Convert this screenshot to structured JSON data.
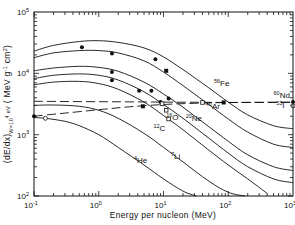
{
  "chart_data": {
    "type": "line",
    "title": "",
    "xlabel": "Energy per nucleon (MeV)",
    "ylabel": "(dE/dx)_{W=10^4 eV} (MeV g^-1 cm^2)",
    "xscale": "log",
    "yscale": "log",
    "xlim": [
      0.1,
      1000
    ],
    "ylim": [
      100,
      100000
    ],
    "x_ticks": [
      {
        "value": 0.1,
        "base": "10",
        "exp": "-1"
      },
      {
        "value": 1,
        "base": "10",
        "exp": "0"
      },
      {
        "value": 10,
        "base": "10",
        "exp": "1"
      },
      {
        "value": 100,
        "base": "10",
        "exp": "2"
      },
      {
        "value": 1000,
        "base": "10",
        "exp": "3"
      }
    ],
    "y_ticks": [
      {
        "value": 100,
        "base": "10",
        "exp": "2"
      },
      {
        "value": 1000,
        "base": "10",
        "exp": "3"
      },
      {
        "value": 10000,
        "base": "10",
        "exp": "4"
      },
      {
        "value": 100000,
        "base": "10",
        "exp": "5"
      }
    ],
    "series": [
      {
        "name": "56Fe",
        "mass": "56",
        "sym": "Fe",
        "style": "solid",
        "x": [
          0.1,
          0.2,
          0.5,
          1,
          2,
          5,
          10,
          20,
          50,
          100,
          200,
          500,
          1000
        ],
        "y": [
          23000,
          28500,
          33000,
          34000,
          32000,
          26000,
          18500,
          11500,
          5800,
          3400,
          2100,
          1400,
          1250
        ]
      },
      {
        "name": "40Ar",
        "mass": "40",
        "sym": "Ar",
        "style": "solid",
        "x": [
          0.1,
          0.2,
          0.5,
          1,
          2,
          5,
          10,
          20,
          50,
          100,
          200,
          500,
          1000
        ],
        "y": [
          18000,
          21500,
          23500,
          23500,
          21500,
          16000,
          10500,
          6300,
          3100,
          1800,
          1100,
          700,
          620
        ]
      },
      {
        "name": "20Ne",
        "mass": "20",
        "sym": "Ne",
        "style": "solid",
        "x": [
          0.1,
          0.2,
          0.5,
          1,
          2,
          5,
          10,
          20,
          50,
          100,
          200,
          500,
          1000
        ],
        "y": [
          11000,
          12200,
          13000,
          12500,
          10800,
          7200,
          4600,
          2800,
          1350,
          780,
          470,
          300,
          260
        ]
      },
      {
        "name": "16O",
        "mass": "16",
        "sym": "O",
        "style": "solid",
        "x": [
          0.1,
          0.2,
          0.5,
          1,
          2,
          5,
          10,
          20,
          50,
          100,
          200,
          500,
          1000
        ],
        "y": [
          8200,
          9300,
          9800,
          9300,
          7800,
          5000,
          3100,
          1850,
          880,
          500,
          300,
          190,
          165
        ]
      },
      {
        "name": "12C",
        "mass": "12",
        "sym": "C",
        "style": "solid",
        "x": [
          0.1,
          0.2,
          0.5,
          1,
          2,
          5,
          10,
          20,
          50,
          100,
          200,
          400
        ],
        "y": [
          6500,
          7200,
          7400,
          6800,
          5500,
          3400,
          2050,
          1200,
          560,
          320,
          190,
          110
        ]
      },
      {
        "name": "7Li",
        "mass": "7",
        "sym": "Li",
        "style": "solid",
        "x": [
          0.1,
          0.2,
          0.5,
          1,
          2,
          5,
          10,
          20,
          50,
          100,
          180
        ],
        "y": [
          3000,
          3050,
          2900,
          2500,
          1850,
          1050,
          620,
          360,
          175,
          115,
          100
        ]
      },
      {
        "name": "4He",
        "mass": "4",
        "sym": "He",
        "style": "solid",
        "x": [
          0.1,
          0.15,
          0.3,
          0.5,
          1,
          2,
          5,
          10,
          20,
          32
        ],
        "y": [
          1900,
          1850,
          1650,
          1400,
          1000,
          620,
          320,
          190,
          120,
          100
        ]
      },
      {
        "name": "threshold-upper",
        "style": "dashed",
        "x": [
          0.1,
          1,
          10,
          100,
          1000
        ],
        "y": [
          3500,
          3450,
          3400,
          3350,
          3350
        ]
      },
      {
        "name": "threshold-lower",
        "style": "dashed",
        "x": [
          0.1,
          0.3,
          1,
          3,
          10,
          30,
          100,
          1000
        ],
        "y": [
          2000,
          2250,
          2550,
          2850,
          3100,
          3250,
          3350,
          3400
        ]
      }
    ],
    "markers": [
      {
        "series": "56Fe",
        "x": 0.55,
        "y": 26500,
        "shape": "filled-circle"
      },
      {
        "series": "56Fe",
        "x": 7.5,
        "y": 17000,
        "shape": "filled-circle"
      },
      {
        "series": "40Ar",
        "x": 1.6,
        "y": 21000,
        "shape": "filled-circle"
      },
      {
        "series": "40Ar",
        "x": 11,
        "y": 11000,
        "shape": "filled-square"
      },
      {
        "series": "20Ne",
        "x": 1.6,
        "y": 10500,
        "shape": "filled-circle"
      },
      {
        "series": "20Ne",
        "x": 6.5,
        "y": 5200,
        "shape": "filled-circle"
      },
      {
        "series": "20Ne",
        "x": 12,
        "y": 3900,
        "shape": "filled-circle"
      },
      {
        "series": "16O",
        "x": 1.6,
        "y": 7700,
        "shape": "filled-circle"
      },
      {
        "series": "16O",
        "x": 4.2,
        "y": 5200,
        "shape": "filled-circle"
      },
      {
        "series": "16O",
        "x": 9,
        "y": 3400,
        "shape": "filled-circle"
      },
      {
        "series": "40Ar",
        "x": 40,
        "y": 3350,
        "shape": "open-square"
      },
      {
        "series": "56Fe",
        "x": 85,
        "y": 3350,
        "shape": "filled-square"
      },
      {
        "series": "12C",
        "x": 9.5,
        "y": 3200,
        "shape": "open-square"
      },
      {
        "series": "12C",
        "x": 11,
        "y": 2500,
        "shape": "open-square"
      },
      {
        "series": "12C",
        "x": 12,
        "y": 1800,
        "shape": "open-square"
      },
      {
        "series": "threshold-lower",
        "x": 4.8,
        "y": 2900,
        "shape": "filled-square"
      },
      {
        "series": "4He",
        "x": 0.15,
        "y": 1850,
        "shape": "open-circle"
      },
      {
        "series": "edge-left",
        "x": 0.1,
        "y": 2000,
        "shape": "filled-circle"
      },
      {
        "series": "60Nd",
        "x": 1000,
        "y": 3400,
        "shape": "filled-circle"
      },
      {
        "series": "53I",
        "x": 1000,
        "y": 2950,
        "shape": "open-circle"
      }
    ],
    "annotations": [
      {
        "mass": "56",
        "sym": "Fe",
        "x": 60,
        "y": 6200
      },
      {
        "mass": "40",
        "sym": "Ar",
        "x": 45,
        "y": 2650
      },
      {
        "mass": "20",
        "sym": "Ne",
        "x": 22,
        "y": 1700
      },
      {
        "mass": "16",
        "sym": "O",
        "x": 11,
        "y": 1750
      },
      {
        "mass": "12",
        "sym": "C",
        "x": 7,
        "y": 1150
      },
      {
        "mass": "7",
        "sym": "Li",
        "x": 13,
        "y": 400
      },
      {
        "mass": "4",
        "sym": "He",
        "x": 3.5,
        "y": 350
      },
      {
        "mass": "60",
        "sym": "Nd",
        "x": 500,
        "y": 3900
      },
      {
        "mass": "53",
        "sym": "I",
        "x": 550,
        "y": 2750
      }
    ],
    "grid": false,
    "legend": "none"
  }
}
